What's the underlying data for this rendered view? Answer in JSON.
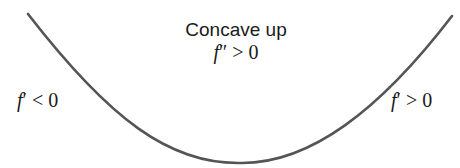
{
  "diagram": {
    "title": "Concave up",
    "center_label": {
      "fn": "f",
      "prime": "″",
      "rel": " > ",
      "val": "0"
    },
    "left_label": {
      "fn": "f",
      "prime": "′",
      "rel": " < ",
      "val": "0"
    },
    "right_label": {
      "fn": "f",
      "prime": "′",
      "rel": " > ",
      "val": "0"
    },
    "curve_color": "#555555",
    "text_color": "#1a1a1a"
  }
}
